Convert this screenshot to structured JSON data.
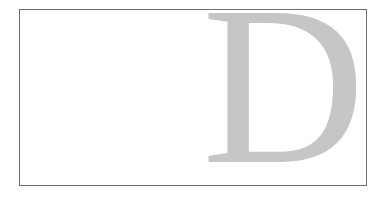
{
  "figure": {
    "letter": "D",
    "letter_color": "#c6c6c6",
    "border_color": "#6e6e6e",
    "background_color": "#ffffff"
  }
}
